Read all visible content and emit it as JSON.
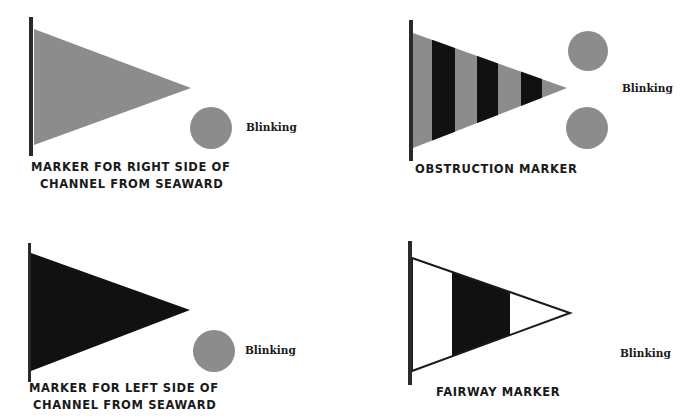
{
  "colors": {
    "background": "#ffffff",
    "gray_fill": "#8c8c8c",
    "black_fill": "#111111",
    "pole": "#2a2a2a"
  },
  "markers": [
    {
      "id": "right-side",
      "caption_line1": "MARKER FOR RIGHT SIDE OF",
      "caption_line2": "CHANNEL FROM SEAWARD",
      "flag_fill": "gray",
      "light_count": 1,
      "light_label": "Blinking"
    },
    {
      "id": "obstruction",
      "caption_line1": "OBSTRUCTION MARKER",
      "flag_fill": "gray with black vertical stripes",
      "light_count": 2,
      "light_label": "Blinking"
    },
    {
      "id": "left-side",
      "caption_line1": "MARKER FOR LEFT SIDE OF",
      "caption_line2": "CHANNEL FROM SEAWARD",
      "flag_fill": "black",
      "light_count": 1,
      "light_label": "Blinking"
    },
    {
      "id": "fairway",
      "caption_line1": "FAIRWAY MARKER",
      "flag_fill": "white with black vertical band",
      "light_count": 0,
      "light_label": "Blinking"
    }
  ]
}
